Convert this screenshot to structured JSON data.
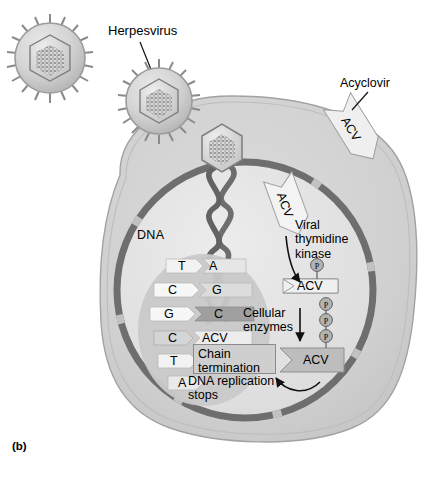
{
  "figure": {
    "panel_label": "(b)",
    "title_concept": "Herpesvirus replication and the mechanism of acyclovir (ACV) chain termination"
  },
  "labels": {
    "herpesvirus": "Herpesvirus",
    "acyclovir": "Acyclovir",
    "dna": "DNA",
    "viral_thymidine_kinase": "Viral\nthymidine\nkinase",
    "cellular_enzymes": "Cellular\nenzymes",
    "chain_termination": "Chain\ntermination",
    "dna_replication_stops": "DNA replication\nstops"
  },
  "drug": {
    "abbrev": "ACV",
    "forms": [
      {
        "id": "acv-extracellular",
        "label": "ACV",
        "phosphates": 0,
        "fill": "light",
        "note": "outside cell, crossing membrane"
      },
      {
        "id": "acv-cytoplasmic",
        "label": "ACV",
        "phosphates": 0,
        "fill": "light",
        "note": "inside cytoplasm, unphosphorylated"
      },
      {
        "id": "acv-monophosphate",
        "label": "ACV",
        "phosphates": 1,
        "fill": "light",
        "note": "after viral thymidine kinase"
      },
      {
        "id": "acv-triphosphate",
        "label": "ACV",
        "phosphates": 3,
        "fill": "gray",
        "note": "after cellular enzymes"
      },
      {
        "id": "acv-incorporated",
        "label": "ACV",
        "phosphates": 0,
        "fill": "light",
        "note": "incorporated into DNA chain"
      }
    ],
    "phosphate_glyph": "P"
  },
  "dna_ladder": {
    "rungs": [
      {
        "left": "T",
        "right": "A"
      },
      {
        "left": "C",
        "right": "G"
      },
      {
        "left": "G",
        "right": "C"
      },
      {
        "left": "C",
        "right": "ACV"
      },
      {
        "left": "T",
        "right": ""
      },
      {
        "left": "A",
        "right": ""
      }
    ]
  },
  "virions": [
    {
      "id": "virion-free",
      "description": "free enveloped herpesvirus particle with surface spikes and icosahedral capsid"
    },
    {
      "id": "virion-attached",
      "description": "herpesvirus particle attached at the cell surface"
    },
    {
      "id": "capsid-at-nucleus",
      "description": "capsid docked at nuclear envelope releasing DNA"
    }
  ],
  "colors": {
    "cell_cytoplasm": "#d2d2d2",
    "cell_outline": "#9a9a9a",
    "nucleoplasm": "#e3e3e3",
    "nuclear_envelope": "#6e6e6e",
    "nuclear_pore": "#bdbdbd",
    "dna_strand": "#636363",
    "drug_arrow_light": "#efefef",
    "drug_arrow_gray": "#c0c0c0",
    "box_fill": "#cfcfcf",
    "text": "#000000"
  }
}
